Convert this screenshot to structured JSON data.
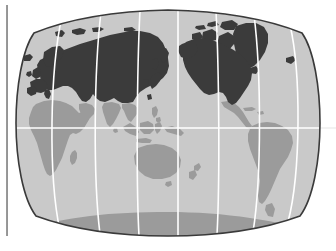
{
  "figure": {
    "type": "world-map",
    "projection": "van-der-grinten-lenticular",
    "title": "",
    "caption": "",
    "frame_rule_visible": true
  },
  "colors": {
    "page_background": "#ffffff",
    "ocean": "#c9c9c9",
    "land_light": "#9b9b9b",
    "land_dark": "#3b3b3b",
    "graticule": "#ffffff",
    "map_border": "#3a3a3a",
    "frame_rule": "#8a8a8a"
  },
  "legend": {
    "visible": false,
    "entries": [
      {
        "swatch": "#3b3b3b",
        "label": ""
      },
      {
        "swatch": "#9b9b9b",
        "label": ""
      }
    ]
  },
  "graticule": {
    "equator_visible": true,
    "meridian_count": 7,
    "parallel_count": 1,
    "line_color": "#ffffff",
    "line_width": 1.6
  },
  "regions_dark": [
    "North America",
    "Greenland",
    "Canadian Arctic Archipelago",
    "Iceland",
    "Europe",
    "British Isles",
    "Scandinavia",
    "Russia",
    "Kazakhstan",
    "Mongolia",
    "China",
    "Korea",
    "Japan",
    "Svalbard"
  ],
  "regions_light": [
    "Africa",
    "Madagascar",
    "Arabian Peninsula",
    "India",
    "Southeast Asia",
    "Indonesia",
    "Philippines",
    "New Guinea",
    "Australia",
    "New Zealand",
    "Mexico",
    "Central America",
    "Caribbean",
    "South America",
    "Antarctica"
  ],
  "map_bounds": {
    "left_px": 17,
    "right_px": 320,
    "top_px": 10,
    "bottom_px": 236
  }
}
